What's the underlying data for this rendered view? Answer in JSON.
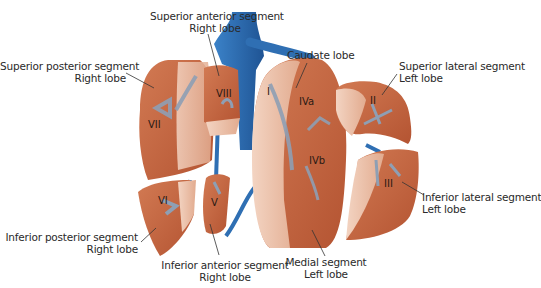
{
  "figure": {
    "colors": {
      "liver": "#c2613d",
      "liver_light": "#e9b9a0",
      "liver_cut": "#f0cdb9",
      "vessel": "#2f6fb3",
      "vessel_dark": "#1f5494",
      "portal_branch": "#8e9fb4",
      "text": "#2a2a2a"
    }
  },
  "labels": {
    "superior_anterior": {
      "line1": "Superior anterior segment",
      "line2": "Right lobe"
    },
    "superior_posterior": {
      "line1": "Superior posterior segment",
      "line2": "Right lobe"
    },
    "caudate": {
      "line1": "Caudate lobe"
    },
    "superior_lateral": {
      "line1": "Superior lateral segment",
      "line2": "Left lobe"
    },
    "inferior_lateral": {
      "line1": "Inferior lateral segment",
      "line2": "Left lobe"
    },
    "inferior_posterior": {
      "line1": "Inferior posterior segment",
      "line2": "Right lobe"
    },
    "inferior_anterior": {
      "line1": "Inferior anterior segment",
      "line2": "Right lobe"
    },
    "medial": {
      "line1": "Medial segment",
      "line2": "Left lobe"
    }
  },
  "segments": {
    "I": "I",
    "II": "II",
    "III": "III",
    "IVa": "IVa",
    "IVb": "IVb",
    "V": "V",
    "VI": "VI",
    "VII": "VII",
    "VIII": "VIII"
  }
}
